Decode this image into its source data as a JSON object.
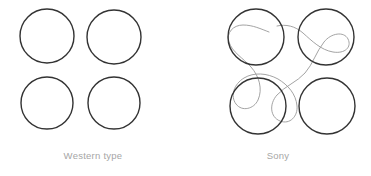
{
  "figure": {
    "background_color": "#ffffff",
    "width": 371,
    "height": 176,
    "panels": [
      {
        "id": "western",
        "caption": "Western type",
        "caption_color": "#a6a6a6",
        "circle_stroke_color": "#333333",
        "circle_stroke_width": 1.4,
        "circle_fill": "none",
        "connector_present": false,
        "circles": [
          {
            "name": "top-left-circle",
            "cx": 47,
            "cy": 36,
            "r": 27
          },
          {
            "name": "top-right-circle",
            "cx": 114,
            "cy": 37,
            "r": 27
          },
          {
            "name": "bottom-left-circle",
            "cx": 47,
            "cy": 103,
            "r": 26
          },
          {
            "name": "bottom-right-circle",
            "cx": 114,
            "cy": 103,
            "r": 26
          }
        ]
      },
      {
        "id": "sony",
        "caption": "Sony",
        "caption_color": "#a6a6a6",
        "circle_stroke_color": "#333333",
        "circle_stroke_width": 1.4,
        "circle_fill": "none",
        "connector_present": true,
        "connector_color": "#999999",
        "connector_stroke_width": 0.9,
        "circles": [
          {
            "name": "top-left-circle",
            "cx": 71,
            "cy": 37,
            "r": 28
          },
          {
            "name": "top-right-circle",
            "cx": 141,
            "cy": 37,
            "r": 28
          },
          {
            "name": "bottom-left-circle",
            "cx": 73,
            "cy": 106,
            "r": 28
          },
          {
            "name": "bottom-right-circle",
            "cx": 142,
            "cy": 106,
            "r": 28
          }
        ]
      }
    ]
  }
}
